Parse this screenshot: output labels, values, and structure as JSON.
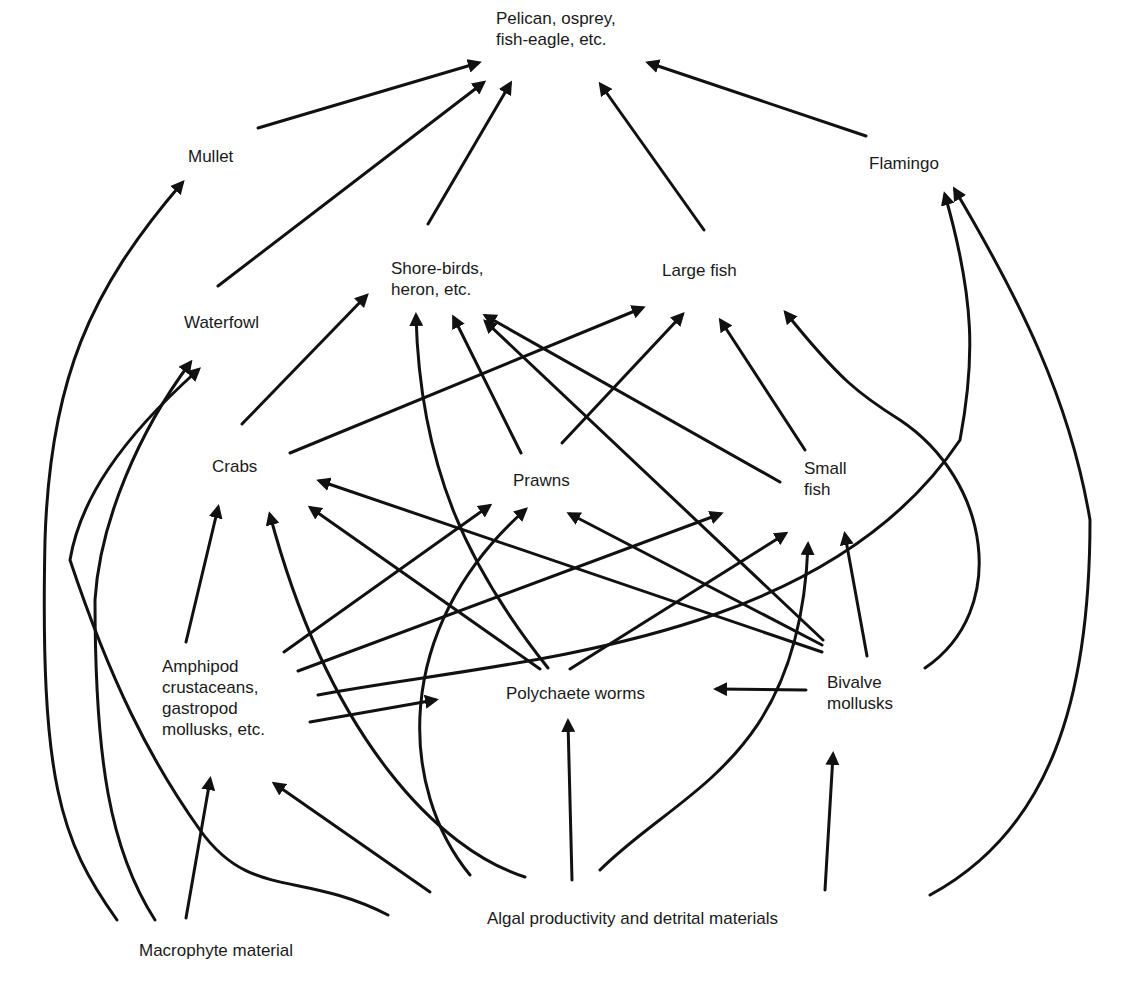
{
  "diagram": {
    "type": "food-web",
    "colors": {
      "ink": "#111111",
      "text": "#1a1a1a",
      "background": "#ffffff"
    },
    "nodes": [
      {
        "id": "top",
        "label": "Pelican, osprey,\nfish-eagle, etc.",
        "x": 496,
        "y": 8
      },
      {
        "id": "mullet",
        "label": "Mullet",
        "x": 188,
        "y": 146
      },
      {
        "id": "flamingo",
        "label": "Flamingo",
        "x": 869,
        "y": 153
      },
      {
        "id": "shorebirds",
        "label": "Shore-birds,\nheron, etc.",
        "x": 391,
        "y": 258
      },
      {
        "id": "largefish",
        "label": "Large fish",
        "x": 662,
        "y": 260
      },
      {
        "id": "waterfowl",
        "label": "Waterfowl",
        "x": 184,
        "y": 312
      },
      {
        "id": "crabs",
        "label": "Crabs",
        "x": 212,
        "y": 456
      },
      {
        "id": "prawns",
        "label": "Prawns",
        "x": 513,
        "y": 470
      },
      {
        "id": "smallfish",
        "label": "Small\nfish",
        "x": 804,
        "y": 458
      },
      {
        "id": "amphipod",
        "label": "Amphipod\ncrustaceans,\ngastropod\nmollusks, etc.",
        "x": 162,
        "y": 656
      },
      {
        "id": "polychaete",
        "label": "Polychaete worms",
        "x": 506,
        "y": 683
      },
      {
        "id": "bivalve",
        "label": "Bivalve\nmollusks",
        "x": 827,
        "y": 672
      },
      {
        "id": "algal",
        "label": "Algal productivity and detrital materials",
        "x": 487,
        "y": 908
      },
      {
        "id": "macrophyte",
        "label": "Macrophyte material",
        "x": 139,
        "y": 940
      }
    ],
    "edges": [
      {
        "from": "mullet",
        "to": "top",
        "d": "M258 128 L478 63"
      },
      {
        "from": "waterfowl",
        "to": "top",
        "d": "M218 286 L483 83"
      },
      {
        "from": "shorebirds",
        "to": "top",
        "d": "M428 224 L510 84"
      },
      {
        "from": "largefish",
        "to": "top",
        "d": "M704 230 L601 85"
      },
      {
        "from": "flamingo",
        "to": "top",
        "d": "M866 136 L649 63"
      },
      {
        "from": "crabs",
        "to": "shorebirds",
        "d": "M242 424 L366 296"
      },
      {
        "from": "crabs",
        "to": "largefish",
        "d": "M290 453 L642 308"
      },
      {
        "from": "prawns",
        "to": "shorebirds",
        "d": "M521 453 L454 318"
      },
      {
        "from": "prawns",
        "to": "largefish",
        "d": "M562 443 L682 315"
      },
      {
        "from": "smallfish",
        "to": "shorebirds",
        "d": "M780 482 L486 316"
      },
      {
        "from": "smallfish",
        "to": "largefish",
        "d": "M805 450 L721 321"
      },
      {
        "from": "bivalve",
        "to": "shorebirds",
        "d": "M823 640 L486 322"
      },
      {
        "from": "polychaete",
        "to": "shorebirds",
        "d": "M548 668 C470 570 420 470 416 316"
      },
      {
        "from": "bivalve",
        "to": "largefish",
        "d": "M925 668 C1010 610 990 480 900 420 C860 395 840 380 786 313"
      },
      {
        "from": "amphipod",
        "to": "crabs",
        "d": "M186 642 L218 508"
      },
      {
        "from": "algal",
        "to": "crabs",
        "d": "M525 877 C440 850 330 740 270 515"
      },
      {
        "from": "polychaete",
        "to": "crabs",
        "d": "M540 669 L311 508"
      },
      {
        "from": "bivalve",
        "to": "crabs",
        "d": "M822 652 L320 481"
      },
      {
        "from": "amphipod",
        "to": "prawns",
        "d": "M284 652 L489 506"
      },
      {
        "from": "algal",
        "to": "prawns",
        "d": "M470 875 C400 790 390 630 525 510"
      },
      {
        "from": "bivalve",
        "to": "prawns",
        "d": "M822 645 L570 514"
      },
      {
        "from": "amphipod",
        "to": "smallfish",
        "d": "M298 671 L720 514"
      },
      {
        "from": "polychaete",
        "to": "smallfish",
        "d": "M570 669 L785 534"
      },
      {
        "from": "algal",
        "to": "smallfish",
        "d": "M600 870 C680 790 800 760 808 545"
      },
      {
        "from": "bivalve",
        "to": "smallfish",
        "d": "M867 656 L845 535"
      },
      {
        "from": "bivalve",
        "to": "polychaete",
        "d": "M806 690 L717 689"
      },
      {
        "from": "amphipod",
        "to": "polychaete",
        "d": "M310 722 L435 700"
      },
      {
        "from": "amphipod",
        "to": "flamingo",
        "d": "M318 695 C500 660 820 650 960 440 C975 360 975 300 945 195"
      },
      {
        "from": "algal",
        "to": "flamingo",
        "d": "M930 895 C1050 830 1090 700 1090 520 C1070 400 1020 300 955 190"
      },
      {
        "from": "algal",
        "to": "polychaete",
        "d": "M572 880 L568 722"
      },
      {
        "from": "algal",
        "to": "bivalve",
        "d": "M825 890 L833 755"
      },
      {
        "from": "algal",
        "to": "amphipod",
        "d": "M430 892 L275 784"
      },
      {
        "from": "macrophyte",
        "to": "amphipod",
        "d": "M186 918 L210 780"
      },
      {
        "from": "macrophyte",
        "to": "mullet",
        "d": "M117 920 C60 840 40 780 45 540 C50 380 90 290 182 183"
      },
      {
        "from": "macrophyte",
        "to": "waterfowl",
        "d": "M155 920 C110 850 95 760 95 600 C100 520 140 430 190 363"
      },
      {
        "from": "macrophyte",
        "to": "waterfowl",
        "d": "M388 915 C300 870 250 900 200 830 C150 760 110 680 70 560 C80 500 120 440 198 370"
      }
    ]
  }
}
